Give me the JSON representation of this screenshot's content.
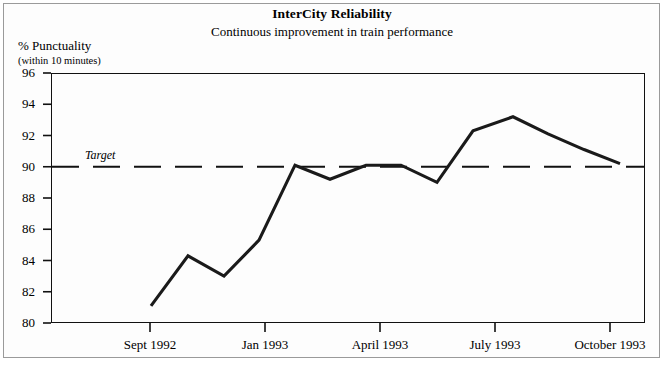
{
  "chart_data": {
    "type": "line",
    "title": "InterCity Reliability",
    "subtitle": "Continuous improvement in train performance",
    "ylabel": "% Punctuality",
    "ylabel_note": "(within 10 minutes)",
    "xlabel": "",
    "ylim": [
      80,
      96
    ],
    "ytick_step": 2,
    "yticks": [
      80,
      82,
      84,
      86,
      88,
      90,
      92,
      94,
      96
    ],
    "xticks": [
      "Sept 1992",
      "Jan 1993",
      "April 1993",
      "July 1993",
      "October 1993"
    ],
    "xtick_positions": [
      150,
      265,
      380,
      495,
      610
    ],
    "grid": false,
    "legend": false,
    "line_color": "#1a1a1a",
    "target": {
      "label": "Target",
      "value": 90,
      "style": "dashed",
      "color": "#111111"
    },
    "x": [
      151,
      188,
      224,
      259,
      295,
      330,
      366,
      401,
      437,
      473,
      513,
      548,
      584,
      620
    ],
    "values": [
      81.1,
      84.3,
      83.0,
      85.3,
      90.1,
      89.2,
      90.1,
      90.1,
      89.0,
      92.3,
      93.2,
      92.1,
      91.1,
      90.2
    ],
    "series": [
      {
        "name": "Punctuality",
        "values": [
          81.1,
          84.3,
          83.0,
          85.3,
          90.1,
          89.2,
          90.1,
          90.1,
          89.0,
          92.3,
          93.2,
          92.1,
          91.1,
          90.2
        ]
      }
    ]
  }
}
